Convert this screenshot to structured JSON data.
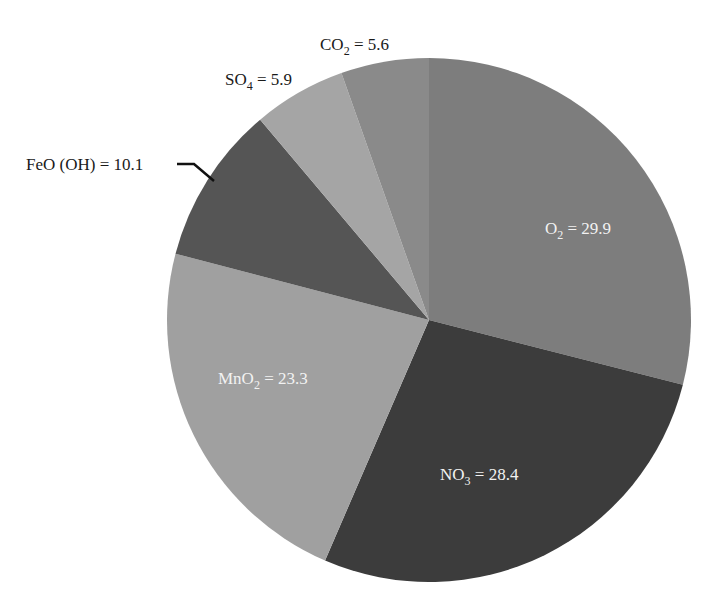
{
  "chart_data": {
    "type": "pie",
    "title": "",
    "start_angle_deg": 0,
    "direction": "clockwise",
    "center": [
      429,
      320
    ],
    "radius": 262,
    "slices": [
      {
        "name": "O2",
        "label": "O",
        "sub": "2",
        "rest": " = 29.9",
        "value": 29.9,
        "color": "#7d7d7d",
        "label_pos": [
          545,
          234
        ],
        "label_class": "lbl-in"
      },
      {
        "name": "NO3",
        "label": "NO",
        "sub": "3",
        "rest": " = 28.4",
        "value": 28.4,
        "color": "#3c3c3c",
        "label_pos": [
          440,
          480
        ],
        "label_class": "lbl-in"
      },
      {
        "name": "MnO2",
        "label": "MnO",
        "sub": "2",
        "rest": " = 23.3",
        "value": 23.3,
        "color": "#a0a0a0",
        "label_pos": [
          218,
          384
        ],
        "label_class": "lbl-in"
      },
      {
        "name": "FeO(OH)",
        "label": "FeO (OH) = 10.1",
        "sub": "",
        "rest": "",
        "value": 10.1,
        "color": "#555555",
        "label_pos": [
          26,
          170
        ],
        "label_class": "lbl-out"
      },
      {
        "name": "SO4",
        "label": "SO",
        "sub": "4",
        "rest": " = 5.9",
        "value": 5.9,
        "color": "#a5a5a5",
        "label_pos": [
          225,
          85
        ],
        "label_class": "lbl-out"
      },
      {
        "name": "CO2",
        "label": "CO",
        "sub": "2",
        "rest": " = 5.6",
        "value": 5.6,
        "color": "#8a8a8a",
        "label_pos": [
          320,
          50
        ],
        "label_class": "lbl-out"
      }
    ],
    "leader_line": {
      "for": "FeO(OH)",
      "points": [
        [
          177,
          164
        ],
        [
          194,
          164
        ],
        [
          214,
          181
        ]
      ]
    },
    "legend": null
  }
}
